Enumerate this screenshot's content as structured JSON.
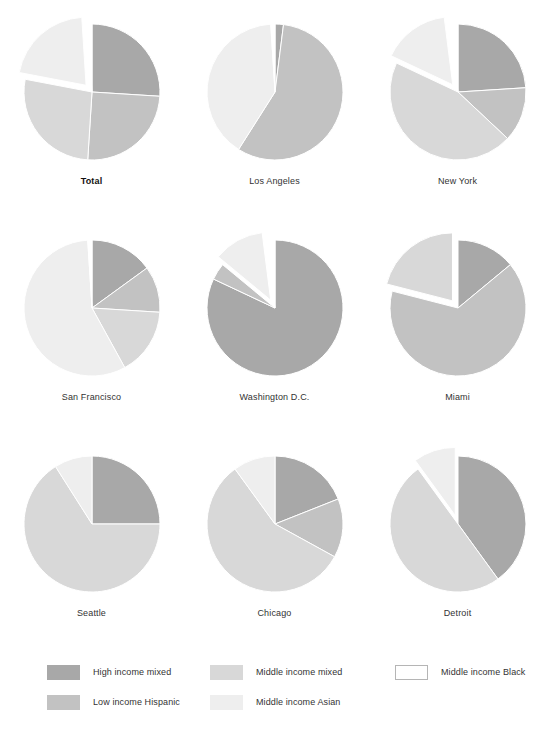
{
  "chart_data": {
    "type": "pie",
    "title": "",
    "subtitle": "",
    "legend_position": "bottom",
    "categories": [
      "High income mixed",
      "Low income Hispanic",
      "Middle income mixed",
      "Middle income Asian",
      "Middle income Black"
    ],
    "colors": {
      "High income mixed": "#a8a8a8",
      "Low income Hispanic": "#c2c2c2",
      "Middle income mixed": "#d8d8d8",
      "Middle income Asian": "#eeeeee",
      "Middle income Black": "#ffffff"
    },
    "series": [
      {
        "name": "Total",
        "bold": true,
        "values": [
          26,
          25,
          27,
          21,
          1
        ],
        "exploded": [
          "Middle income Asian"
        ]
      },
      {
        "name": "Los Angeles",
        "bold": false,
        "values": [
          2,
          57,
          0,
          40,
          1
        ],
        "exploded": []
      },
      {
        "name": "New York",
        "bold": false,
        "values": [
          24,
          13,
          45,
          16,
          2
        ],
        "exploded": [
          "Middle income Asian"
        ]
      },
      {
        "name": "San Francisco",
        "bold": false,
        "values": [
          15,
          11,
          16,
          57,
          1
        ],
        "exploded": []
      },
      {
        "name": "Washington D.C.",
        "bold": false,
        "values": [
          82,
          4,
          0,
          12,
          2
        ],
        "exploded": [
          "Middle income Asian"
        ]
      },
      {
        "name": "Miami",
        "bold": false,
        "values": [
          14,
          65,
          21,
          0,
          0
        ],
        "exploded": [
          "Middle income mixed"
        ]
      },
      {
        "name": "Seattle",
        "bold": false,
        "values": [
          25,
          0,
          66,
          9,
          0
        ],
        "exploded": []
      },
      {
        "name": "Chicago",
        "bold": false,
        "values": [
          19,
          14,
          57,
          10,
          0
        ],
        "exploded": []
      },
      {
        "name": "Detroit",
        "bold": false,
        "values": [
          40,
          0,
          50,
          10,
          0
        ],
        "exploded": [
          "Middle income Asian"
        ]
      }
    ]
  },
  "legend": {
    "columns": [
      {
        "items": [
          {
            "label": "High income mixed",
            "color": "#a8a8a8",
            "border": false
          },
          {
            "label": "Low income Hispanic",
            "color": "#c2c2c2",
            "border": false
          }
        ]
      },
      {
        "items": [
          {
            "label": "Middle income mixed",
            "color": "#d8d8d8",
            "border": false
          },
          {
            "label": "Middle income Asian",
            "color": "#eeeeee",
            "border": false
          }
        ]
      },
      {
        "items": [
          {
            "label": "Middle income Black",
            "color": "#ffffff",
            "border": true
          }
        ]
      }
    ]
  }
}
